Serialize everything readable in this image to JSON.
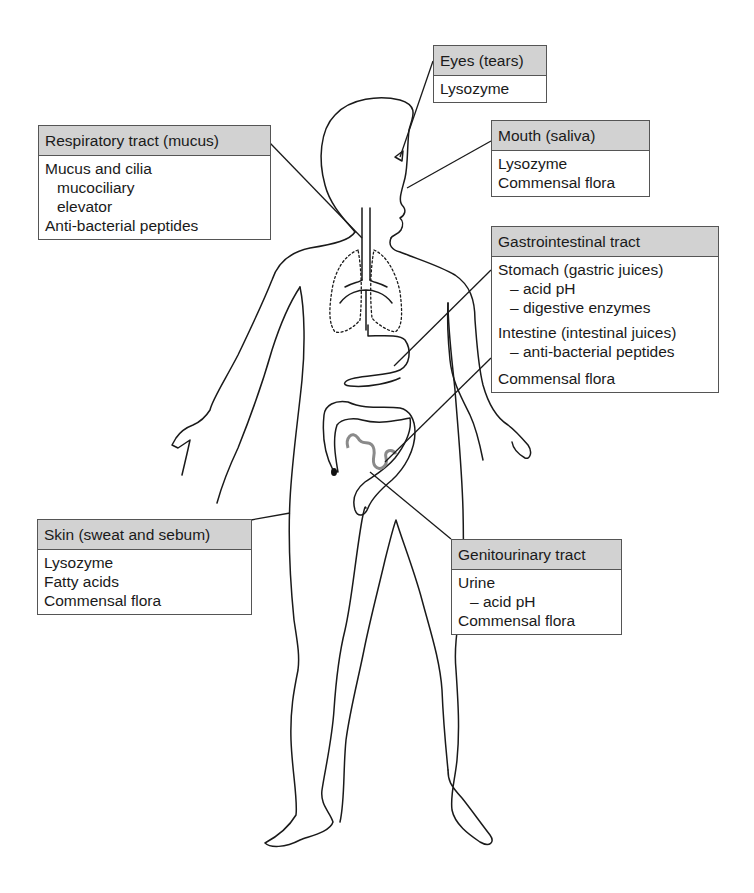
{
  "figure": {
    "colors": {
      "header_fill": "#d2d2d2",
      "box_border": "#555555",
      "outline": "#1a1a1a",
      "intestine_gray": "#8a8a8a"
    }
  },
  "labels": {
    "eyes": {
      "header": "Eyes (tears)",
      "items": [
        {
          "text": "Lysozyme",
          "indent": 0
        }
      ]
    },
    "respiratory": {
      "header": "Respiratory tract (mucus)",
      "items": [
        {
          "text": "Mucus and cilia",
          "indent": 0
        },
        {
          "text": "mucociliary",
          "indent": 1
        },
        {
          "text": "elevator",
          "indent": 1
        },
        {
          "text": "Anti-bacterial peptides",
          "indent": 0
        }
      ]
    },
    "mouth": {
      "header": "Mouth (saliva)",
      "items": [
        {
          "text": "Lysozyme",
          "indent": 0
        },
        {
          "text": "Commensal flora",
          "indent": 0
        }
      ]
    },
    "gastrointestinal": {
      "header": "Gastrointestinal tract",
      "items": [
        {
          "text": "Stomach (gastric juices)",
          "indent": 0
        },
        {
          "text": "– acid pH",
          "indent": 1
        },
        {
          "text": "– digestive enzymes",
          "indent": 1
        },
        {
          "text": "Intestine (intestinal juices)",
          "indent": 0
        },
        {
          "text": "– anti-bacterial peptides",
          "indent": 1
        },
        {
          "text": "Commensal flora",
          "indent": 0
        }
      ]
    },
    "skin": {
      "header": "Skin (sweat and sebum)",
      "items": [
        {
          "text": "Lysozyme",
          "indent": 0
        },
        {
          "text": "Fatty acids",
          "indent": 0
        },
        {
          "text": "Commensal flora",
          "indent": 0
        }
      ]
    },
    "genitourinary": {
      "header": "Genitourinary tract",
      "items": [
        {
          "text": "Urine",
          "indent": 0
        },
        {
          "text": "– acid pH",
          "indent": 1
        },
        {
          "text": "Commensal flora",
          "indent": 0
        }
      ]
    }
  }
}
